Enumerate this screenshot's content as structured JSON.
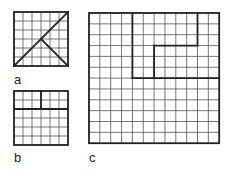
{
  "colors": {
    "background": "#ffffff",
    "grid_line": "#555555",
    "outline": "#222222"
  },
  "figures": [
    {
      "id": "a",
      "label": "a",
      "x": 14,
      "y": 12,
      "cols": 6,
      "rows": 6,
      "cell": 9,
      "label_pos": {
        "x": 14,
        "y": 73
      },
      "thick_lines": [
        [
          0,
          6,
          6,
          0
        ],
        [
          3,
          3,
          6,
          6
        ]
      ]
    },
    {
      "id": "b",
      "label": "b",
      "x": 14,
      "y": 91,
      "cols": 6,
      "rows": 6,
      "cell": 9,
      "label_pos": {
        "x": 14,
        "y": 151
      },
      "thick_lines": [
        [
          0,
          2,
          6,
          2
        ],
        [
          3,
          0,
          3,
          2
        ]
      ]
    },
    {
      "id": "c",
      "label": "c",
      "x": 89,
      "y": 13,
      "cols": 12,
      "rows": 12,
      "cell": 10.85,
      "label_pos": {
        "x": 89,
        "y": 151
      },
      "thick_lines": [
        [
          4,
          0,
          4,
          6
        ],
        [
          4,
          6,
          12,
          6
        ],
        [
          10,
          0,
          10,
          3
        ],
        [
          6,
          3,
          10,
          3
        ],
        [
          6,
          3,
          6,
          6
        ]
      ]
    }
  ]
}
